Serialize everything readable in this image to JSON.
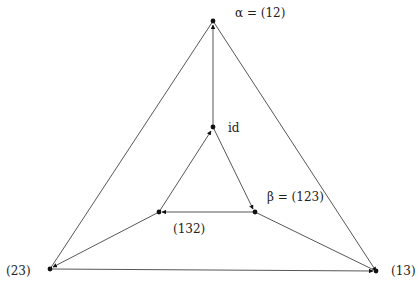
{
  "diagram": {
    "type": "cayley-graph",
    "nodes": [
      {
        "id": "alpha",
        "label": "α = (12)",
        "x": 213,
        "y": 21
      },
      {
        "id": "id",
        "label": "id",
        "x": 213,
        "y": 127
      },
      {
        "id": "beta",
        "label": "β = (123)",
        "x": 255,
        "y": 212
      },
      {
        "id": "c132",
        "label": "(132)",
        "x": 159,
        "y": 212
      },
      {
        "id": "c23",
        "label": "(23)",
        "x": 50,
        "y": 269
      },
      {
        "id": "c13",
        "label": "(13)",
        "x": 376,
        "y": 271
      }
    ],
    "edges": [
      {
        "from": "id",
        "to": "alpha"
      },
      {
        "from": "alpha",
        "to": "c23"
      },
      {
        "from": "alpha",
        "to": "c13"
      },
      {
        "from": "c23",
        "to": "c13"
      },
      {
        "from": "id",
        "to": "beta"
      },
      {
        "from": "beta",
        "to": "c132"
      },
      {
        "from": "c132",
        "to": "id"
      },
      {
        "from": "c132",
        "to": "c23"
      },
      {
        "from": "beta",
        "to": "c13"
      }
    ]
  },
  "labels": {
    "alpha": "α = (12)",
    "id": "id",
    "beta": "β = (123)",
    "c132": "(132)",
    "c23": "(23)",
    "c13": "(13)"
  }
}
